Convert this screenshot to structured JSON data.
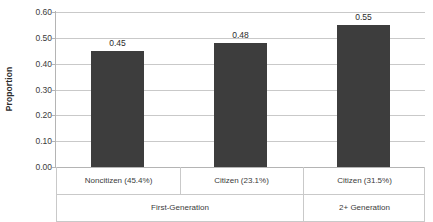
{
  "chart_data": {
    "type": "bar",
    "title": "",
    "xlabel": "",
    "ylabel": "Proportion",
    "ylim": [
      0.0,
      0.6
    ],
    "yticks": [
      "0.00",
      "0.10",
      "0.20",
      "0.30",
      "0.40",
      "0.50",
      "0.60"
    ],
    "ytick_values": [
      0.0,
      0.1,
      0.2,
      0.3,
      0.4,
      0.5,
      0.6
    ],
    "grid": true,
    "legend": "none",
    "bar_color": "#3d3d3d",
    "gridline_color": "#c9c9c9",
    "categories": [
      "Noncitizen (45.4%)",
      "Citizen (23.1%)",
      "Citizen (31.5%)"
    ],
    "values": [
      0.45,
      0.48,
      0.55
    ],
    "data_labels": [
      "0.45",
      "0.48",
      "0.55"
    ],
    "groups": [
      {
        "label": "First-Generation",
        "span": 2
      },
      {
        "label": "2+ Generation",
        "span": 1
      }
    ]
  }
}
